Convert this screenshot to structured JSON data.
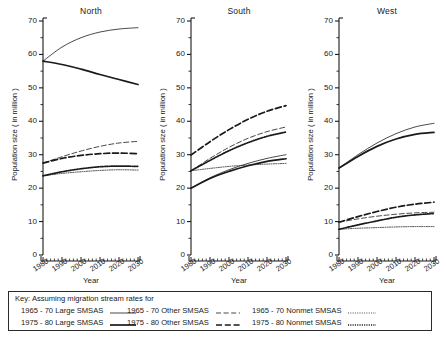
{
  "chart_data": {
    "type": "line",
    "title": "",
    "panels": [
      "North",
      "South",
      "West"
    ],
    "xlabel": "Year",
    "ylabel": "Population size ( in million )",
    "x": [
      1980,
      1990,
      2000,
      2010,
      2020,
      2030
    ],
    "xlim": [
      1980,
      2030
    ],
    "ylim": [
      0,
      70
    ],
    "yticks": [
      0,
      10,
      20,
      30,
      40,
      50,
      60,
      70
    ],
    "ytick_minor_step": 5,
    "xticks": [
      1980,
      1990,
      2000,
      2010,
      2020,
      2030
    ],
    "xtick_minor_step": 2,
    "grid": false,
    "legend_position": "bottom",
    "legend_title": "Key: Assuming migration stream rates for",
    "series_names": [
      "1965-70 Large SMSAS",
      "1975-80 Large SMSAS",
      "1965-70 Other SMSAS",
      "1975-80 Other SMSAS",
      "1965-70 Nonmet SMSAS",
      "1975-80 Nonmet SMSAS"
    ],
    "panel_series": [
      {
        "panel": "North",
        "series": [
          {
            "name": "1965-70 Large SMSAS",
            "style": "solid-thin",
            "values": [
              58.0,
              62.2,
              65.0,
              66.7,
              67.6,
              68.0
            ]
          },
          {
            "name": "1975-80 Large SMSAS",
            "style": "solid-thick",
            "values": [
              58.0,
              57.0,
              55.6,
              54.0,
              52.5,
              51.0
            ]
          },
          {
            "name": "1965-70 Other SMSAS",
            "style": "dashed-thin",
            "values": [
              27.5,
              29.4,
              31.1,
              32.5,
              33.5,
              34.0
            ]
          },
          {
            "name": "1975-80 Other SMSAS",
            "style": "dashed-thick",
            "values": [
              27.5,
              28.9,
              29.8,
              30.3,
              30.5,
              30.3
            ]
          },
          {
            "name": "1965-70 Nonmet SMSAS",
            "style": "dotted-fine",
            "values": [
              23.7,
              24.4,
              24.9,
              25.3,
              25.5,
              25.4
            ]
          },
          {
            "name": "1975-80 Nonmet SMSAS",
            "style": "dotted-coarse",
            "values": [
              23.7,
              24.9,
              25.8,
              26.4,
              26.6,
              26.5
            ]
          }
        ]
      },
      {
        "panel": "South",
        "series": [
          {
            "name": "1965-70 Large SMSAS",
            "style": "solid-thin",
            "values": [
              20.0,
              23.1,
              25.5,
              27.4,
              28.9,
              30.0
            ]
          },
          {
            "name": "1975-80 Large SMSAS",
            "style": "solid-thick",
            "values": [
              20.0,
              22.9,
              25.0,
              26.7,
              28.0,
              28.8
            ]
          },
          {
            "name": "1965-70 Other SMSAS",
            "style": "dashed-thin",
            "values": [
              25.2,
              28.9,
              32.2,
              34.9,
              36.9,
              38.3
            ]
          },
          {
            "name": "1975-80 Other SMSAS",
            "style": "dashed-thick",
            "values": [
              29.9,
              33.9,
              37.5,
              40.6,
              43.0,
              44.7
            ]
          },
          {
            "name": "1965-70 Nonmet SMSAS",
            "style": "dotted-fine",
            "values": [
              25.2,
              25.9,
              26.5,
              26.9,
              27.2,
              27.4
            ]
          },
          {
            "name": "1975-80 Nonmet SMSAS",
            "style": "dotted-coarse",
            "values": [
              25.2,
              28.3,
              31.2,
              33.6,
              35.5,
              36.8
            ]
          }
        ]
      },
      {
        "panel": "West",
        "series": [
          {
            "name": "1965-70 Large SMSAS",
            "style": "solid-thin",
            "values": [
              26.0,
              30.0,
              33.5,
              36.3,
              38.3,
              39.4
            ]
          },
          {
            "name": "1975-80 Large SMSAS",
            "style": "solid-thick",
            "values": [
              26.0,
              29.5,
              32.5,
              34.7,
              36.1,
              36.7
            ]
          },
          {
            "name": "1965-70 Other SMSAS",
            "style": "dashed-thin",
            "values": [
              9.8,
              10.8,
              11.6,
              12.2,
              12.6,
              12.8
            ]
          },
          {
            "name": "1975-80 Other SMSAS",
            "style": "dashed-thick",
            "values": [
              9.8,
              11.5,
              13.0,
              14.3,
              15.2,
              15.8
            ]
          },
          {
            "name": "1965-70 Nonmet SMSAS",
            "style": "dotted-fine",
            "values": [
              7.7,
              8.0,
              8.2,
              8.4,
              8.5,
              8.5
            ]
          },
          {
            "name": "1975-80 Nonmet SMSAS",
            "style": "dotted-coarse",
            "values": [
              7.7,
              9.0,
              10.2,
              11.3,
              12.0,
              12.4
            ]
          }
        ]
      }
    ]
  },
  "axes": {
    "ylabel": "Population size ( in million )",
    "xlabel": "Year",
    "ytick_labels": [
      "0",
      "10",
      "20",
      "30",
      "40",
      "50",
      "60",
      "70"
    ],
    "xtick_labels": [
      "1980",
      "1990",
      "2000",
      "2010",
      "2020",
      "2030"
    ]
  },
  "legend": {
    "title": "Key: Assuming migration stream rates for",
    "rows": [
      [
        {
          "label": "1965 - 70 Large SMSAS",
          "style": "solid-thin"
        },
        {
          "label": "1965 - 70 Other SMSAS",
          "style": "dashed-thin"
        },
        {
          "label": "1965 - 70 Nonmet SMSAS",
          "style": "dotted-fine"
        }
      ],
      [
        {
          "label": "1975 - 80 Large SMSAS",
          "style": "solid-thick"
        },
        {
          "label": "1975 - 80 Other SMSAS",
          "style": "dashed-thick"
        },
        {
          "label": "1975 - 80 Nonmet SMSAS",
          "style": "dotted-coarse"
        }
      ]
    ]
  },
  "colors": {
    "ink": "#1a1a1a",
    "background": "#ffffff"
  }
}
